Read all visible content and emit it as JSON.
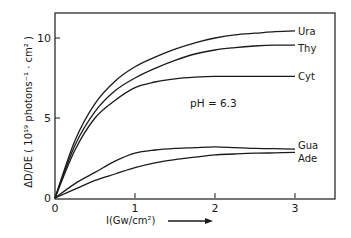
{
  "chart_data": {
    "type": "line",
    "title": "",
    "xlabel": "I(Gw/cm²)",
    "ylabel": "ΔD/DE ( 10¹⁹ photons⁻¹ · cm² )",
    "xlim": [
      0,
      3.5
    ],
    "ylim": [
      0,
      11.6
    ],
    "x_ticks": [
      0,
      1,
      2,
      3
    ],
    "x_tick_labels": [
      "0",
      "1",
      "2",
      "3"
    ],
    "y_ticks": [
      0,
      5,
      10
    ],
    "y_tick_labels": [
      "0",
      "5",
      "10"
    ],
    "grid": false,
    "legend": "inline labels at right end of curves",
    "annotations": [
      {
        "text": "pH = 6.3"
      }
    ],
    "x": [
      0,
      0.25,
      0.5,
      0.75,
      1.0,
      1.25,
      1.5,
      1.75,
      2.0,
      2.25,
      2.5,
      2.75,
      3.0
    ],
    "series": [
      {
        "name": "Ura",
        "values": [
          0,
          3.6,
          5.9,
          7.3,
          8.2,
          8.8,
          9.3,
          9.7,
          10.0,
          10.2,
          10.3,
          10.4,
          10.45
        ]
      },
      {
        "name": "Thy",
        "values": [
          0,
          3.3,
          5.4,
          6.7,
          7.5,
          8.1,
          8.6,
          9.0,
          9.25,
          9.4,
          9.5,
          9.55,
          9.55
        ]
      },
      {
        "name": "Cyt",
        "values": [
          0,
          3.0,
          5.0,
          6.1,
          6.9,
          7.25,
          7.45,
          7.55,
          7.6,
          7.6,
          7.6,
          7.6,
          7.6
        ]
      },
      {
        "name": "Gua",
        "values": [
          0,
          0.9,
          1.6,
          2.3,
          2.8,
          3.0,
          3.1,
          3.15,
          3.2,
          3.15,
          3.1,
          3.08,
          3.05
        ]
      },
      {
        "name": "Ade",
        "values": [
          0,
          0.55,
          1.1,
          1.5,
          1.9,
          2.2,
          2.4,
          2.55,
          2.7,
          2.75,
          2.8,
          2.82,
          2.85
        ]
      }
    ],
    "label_x_end": 3.0
  },
  "arrow_icon": "right-arrow"
}
